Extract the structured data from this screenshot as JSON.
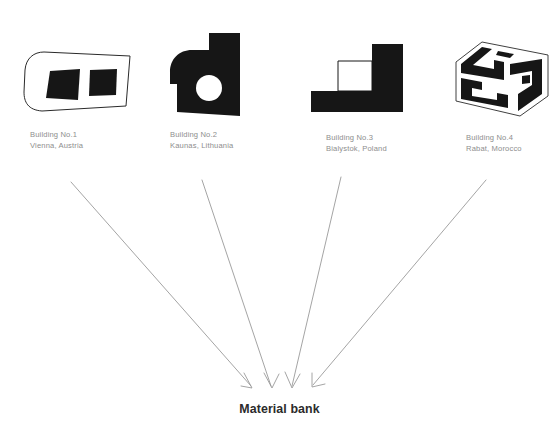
{
  "diagram": {
    "title_bottom": "Material bank",
    "background_color": "#ffffff",
    "caption_color": "#8e8e8e",
    "shape_fill_color": "#161616",
    "arrow_color": "#9a9a9a",
    "label_color": "#2b2b2b"
  },
  "buildings": [
    {
      "id": "building-1",
      "name": "Building No.1",
      "location": "Vienna, Austria",
      "shape_type": "outlined-plan-with-two-dark-windows"
    },
    {
      "id": "building-2",
      "name": "Building No.2",
      "location": "Kaunas, Lithuania",
      "shape_type": "solid-black-rounded-corner-with-circular-void"
    },
    {
      "id": "building-3",
      "name": "Building No.3",
      "location": "Bialystok, Poland",
      "shape_type": "solid-black-stepped-block-with-rectangular-void"
    },
    {
      "id": "building-4",
      "name": "Building No.4",
      "location": "Rabat, Morocco",
      "shape_type": "axonometric-box-with-maze-pattern"
    }
  ],
  "arrows": [
    {
      "id": "arrow-from-building-1",
      "from": "Building No.1",
      "to": "Material bank"
    },
    {
      "id": "arrow-from-building-2",
      "from": "Building No.2",
      "to": "Material bank"
    },
    {
      "id": "arrow-from-building-3",
      "from": "Building No.3",
      "to": "Material bank"
    },
    {
      "id": "arrow-from-building-4",
      "from": "Building No.4",
      "to": "Material bank"
    }
  ]
}
